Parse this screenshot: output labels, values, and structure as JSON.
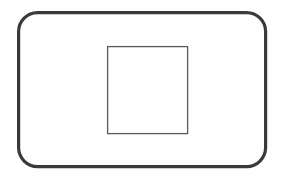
{
  "canvas": {
    "width": 285,
    "height": 181,
    "background_color": "#fefefe",
    "title": "Rounded rectangle enclosing a square"
  },
  "shapes": [
    {
      "name": "outer-rounded-rectangle",
      "type": "rounded-rectangle",
      "x": 18.6,
      "y": 12.6,
      "width": 247.0,
      "height": 154.0,
      "corner_radius": 19,
      "stroke_color": "#3a3a3a",
      "stroke_width": 3.2,
      "fill": "none"
    },
    {
      "name": "inner-square",
      "type": "rectangle",
      "x": 107.6,
      "y": 46.6,
      "width": 80.0,
      "height": 87.0,
      "corner_radius": 0,
      "stroke_color": "#5a5a5a",
      "stroke_width": 1.3,
      "fill": "none"
    }
  ],
  "colors": {
    "background": "#fefefe",
    "outer_stroke": "#3a3a3a",
    "inner_stroke": "#5a5a5a"
  }
}
